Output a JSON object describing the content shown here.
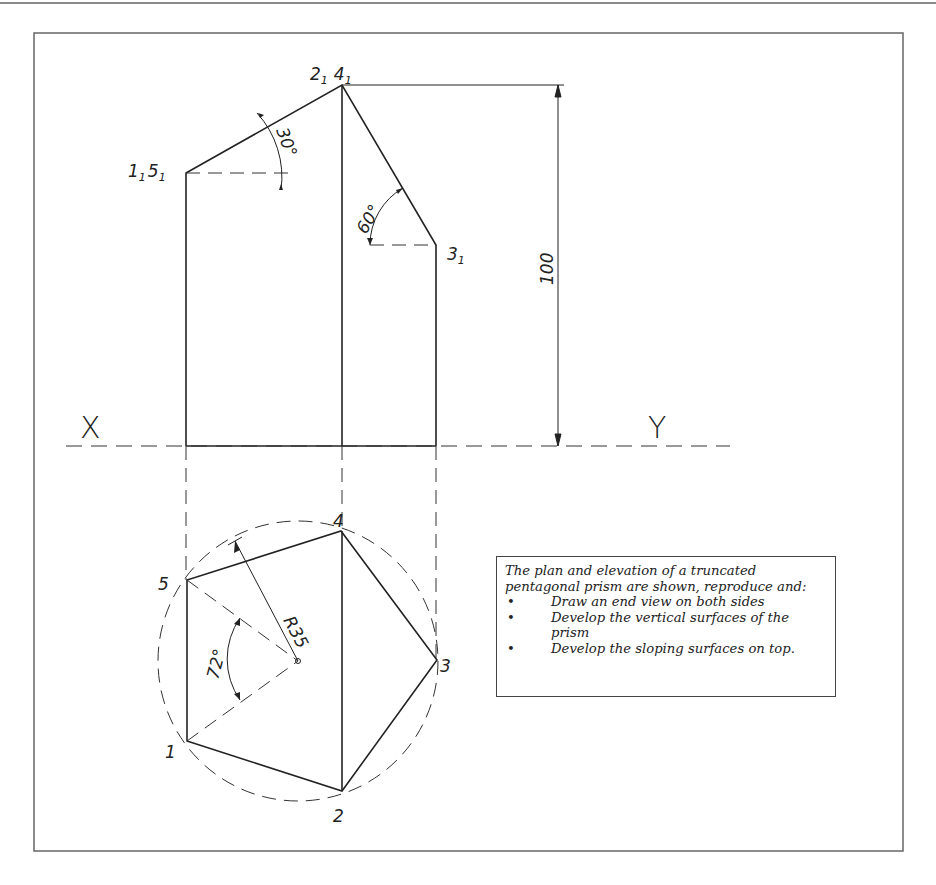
{
  "elevation": {
    "labels": {
      "top_point": "2",
      "top_point_b": "4",
      "left_point": "1",
      "left_point_b": "5",
      "right_point": "3",
      "subscript": "1"
    },
    "dimensions": {
      "height": "100",
      "angle_left": "30°",
      "angle_right": "60°"
    },
    "xy_line": {
      "x_label": "X",
      "y_label": "Y"
    }
  },
  "plan": {
    "vertex_labels": [
      "1",
      "2",
      "3",
      "4",
      "5"
    ],
    "radius_label": "R35",
    "angle_label": "72°"
  },
  "note": {
    "intro": "The plan and elevation of a truncated pentagonal prism are shown, reproduce and:",
    "tasks": [
      "Draw an end view on both sides",
      "Develop the vertical surfaces of the prism",
      " Develop the sloping surfaces on top."
    ]
  },
  "colors": {
    "line": "#222222",
    "frame": "#555555",
    "background": "#ffffff"
  }
}
